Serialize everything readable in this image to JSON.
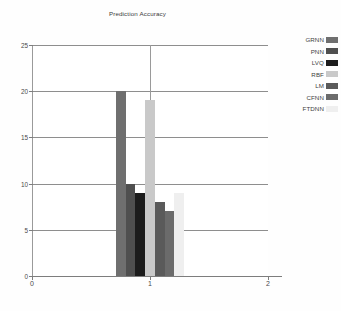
{
  "chart_data": {
    "type": "bar",
    "title": "Prediction Accuracy",
    "xlabel": "",
    "ylabel": "",
    "categories": [
      "GRNN",
      "PNN",
      "LVQ",
      "RBF",
      "LM",
      "CFNN",
      "FTDNN"
    ],
    "values": [
      20,
      10,
      9,
      19,
      8,
      7,
      9
    ],
    "colors": [
      "#6f6f6f",
      "#4f4f4f",
      "#1c1c1c",
      "#c9c9c9",
      "#5a5a5a",
      "#6b6b6b",
      "#efefef"
    ],
    "ylim": [
      0,
      25
    ],
    "yticks": [
      0,
      5,
      10,
      15,
      20,
      25
    ],
    "xlim": [
      0,
      2
    ],
    "xticks": [
      0,
      1,
      2
    ],
    "grid": true,
    "legend_position": "right",
    "legend": [
      {
        "label": "GRNN",
        "color": "#6f6f6f"
      },
      {
        "label": "PNN",
        "color": "#4f4f4f"
      },
      {
        "label": "LVQ",
        "color": "#1c1c1c"
      },
      {
        "label": "RBF",
        "color": "#c9c9c9"
      },
      {
        "label": "LM",
        "color": "#5a5a5a"
      },
      {
        "label": "CFNN",
        "color": "#6b6b6b"
      },
      {
        "label": "FTDNN",
        "color": "#efefef"
      }
    ],
    "bar_group_center_x": 1.0,
    "bar_width_data_units": 0.082
  }
}
